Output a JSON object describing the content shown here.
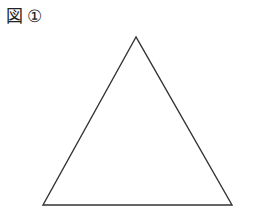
{
  "figure": {
    "label_prefix": "図",
    "label_number": "①"
  },
  "shape": {
    "type": "triangle",
    "vertices": [
      [
        136,
        37
      ],
      [
        43,
        205
      ],
      [
        232,
        205
      ]
    ],
    "stroke": "#333333",
    "stroke_width": 1.4,
    "fill": "none"
  }
}
